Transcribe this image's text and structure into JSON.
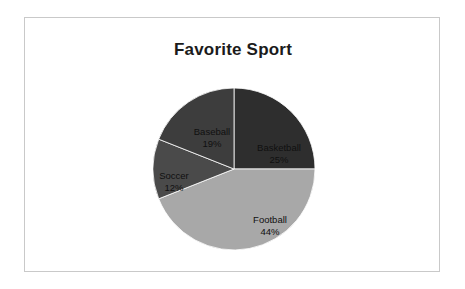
{
  "chart_data": {
    "type": "pie",
    "title": "Favorite Sport",
    "xlabel": "",
    "ylabel": "",
    "legend_position": "none",
    "grid": false,
    "labels_inside": true,
    "label_format": "name + percent",
    "start_angle_deg": 0,
    "direction": "clockwise",
    "categories": [
      "Basketball",
      "Football",
      "Soccer",
      "Baseball"
    ],
    "values": [
      25,
      44,
      12,
      19
    ],
    "units": "%",
    "total": 100,
    "slices": [
      {
        "name": "Basketball",
        "value": 25,
        "percent_label": "25%",
        "color": "#2e2e2e",
        "start_deg": 0,
        "end_deg": 90
      },
      {
        "name": "Football",
        "value": 44,
        "percent_label": "44%",
        "color": "#a8a8a8",
        "start_deg": 90,
        "end_deg": 248.4
      },
      {
        "name": "Soccer",
        "value": 12,
        "percent_label": "12%",
        "color": "#4a4a4a",
        "start_deg": 248.4,
        "end_deg": 291.6
      },
      {
        "name": "Baseball",
        "value": 19,
        "percent_label": "19%",
        "color": "#3d3d3d",
        "start_deg": 291.6,
        "end_deg": 360
      }
    ]
  },
  "style": {
    "background": "#ffffff",
    "frame_border": "#c9c9c9",
    "title_color": "#1b1b1b",
    "label_color": "#101010"
  }
}
